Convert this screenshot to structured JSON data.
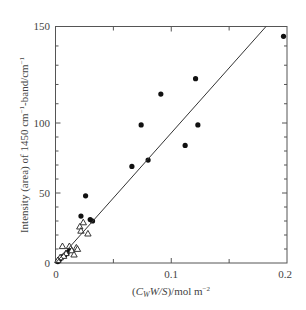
{
  "chart_data": {
    "type": "scatter",
    "title": "",
    "xlabel": "(C_W W/S)/mol m^-2",
    "ylabel": "Intensity (area) of 1450 cm^-1-band/cm^-1",
    "xlim": [
      0,
      0.2
    ],
    "ylim": [
      0,
      150
    ],
    "x_ticks": [
      "0",
      "0.1",
      "0.2"
    ],
    "y_ticks": [
      "0",
      "50",
      "100",
      "150"
    ],
    "grid": false,
    "legend": null,
    "series": [
      {
        "name": "filled circles",
        "marker": "filled-circle",
        "x": [
          0.197,
          0.121,
          0.091,
          0.074,
          0.123,
          0.112,
          0.08,
          0.066,
          0.026,
          0.022,
          0.03,
          0.032,
          0.012,
          0.01,
          0.008,
          0.006,
          0.004,
          0.003,
          0.002
        ],
        "y": [
          145,
          123,
          115,
          98.6,
          98.6,
          84,
          73.5,
          69,
          48,
          33.5,
          31,
          30,
          9,
          7,
          5.5,
          4.5,
          3,
          2,
          1
        ]
      },
      {
        "name": "open triangles",
        "marker": "open-triangle",
        "x": [
          0.024,
          0.021,
          0.022,
          0.028,
          0.006,
          0.018,
          0.019,
          0.012,
          0.009,
          0.007,
          0.004,
          0.002,
          0.014,
          0.016
        ],
        "y": [
          29,
          26,
          23,
          21,
          12,
          11,
          10,
          12,
          7,
          5,
          4,
          2,
          9,
          6
        ]
      },
      {
        "name": "fit line",
        "type": "line",
        "x": [
          0,
          0.182
        ],
        "y": [
          0,
          150
        ]
      }
    ]
  },
  "axes": {
    "x_labels": [
      "0",
      "0.1",
      "0.2"
    ],
    "y_labels": [
      "0",
      "50",
      "100",
      "150"
    ],
    "xlabel_parts": {
      "open": "(",
      "c": "C",
      "sub": "W",
      "rest": "W/S",
      "close": ")/mol m",
      "sup": "−2"
    },
    "ylabel_parts": {
      "a": "Intensity (area) of 1450 cm",
      "sup1": "−1",
      "b": "-band/cm",
      "sup2": "−1"
    }
  }
}
